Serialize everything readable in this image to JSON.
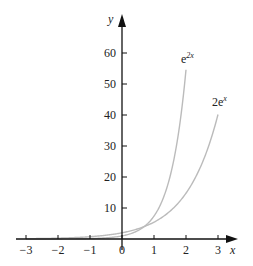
{
  "chart_data": {
    "type": "line",
    "title": "",
    "xlabel": "x",
    "ylabel": "y",
    "xlim": [
      -3.3,
      3.6
    ],
    "ylim": [
      0,
      70
    ],
    "x_ticks": [
      -3,
      -2,
      -1,
      0,
      1,
      2,
      3
    ],
    "x_tick_labels": [
      "−3",
      "−2",
      "−1",
      "0",
      "1",
      "2",
      "3"
    ],
    "y_ticks": [
      10,
      20,
      30,
      40,
      50,
      60
    ],
    "y_tick_labels": [
      "10",
      "20",
      "30",
      "40",
      "50",
      "60"
    ],
    "grid": false,
    "legend": "none (inline curve labels)",
    "series": [
      {
        "name": "e^{2x}",
        "label_base": "e",
        "label_sup": "2x",
        "x_range": [
          -3,
          2
        ],
        "x": [
          -3,
          -2,
          -1,
          0,
          0.5,
          1,
          1.5,
          2
        ],
        "values": [
          0.0025,
          0.018,
          0.135,
          1,
          2.72,
          7.39,
          20.09,
          54.6
        ],
        "color": "#bbbbbb"
      },
      {
        "name": "2e^{x}",
        "label_base": "2e",
        "label_sup": "x",
        "x_range": [
          -3,
          3
        ],
        "x": [
          -3,
          -2,
          -1,
          0,
          1,
          2,
          2.5,
          3
        ],
        "values": [
          0.1,
          0.27,
          0.74,
          2,
          5.44,
          14.78,
          24.36,
          40.17
        ],
        "color": "#bbbbbb"
      }
    ]
  }
}
